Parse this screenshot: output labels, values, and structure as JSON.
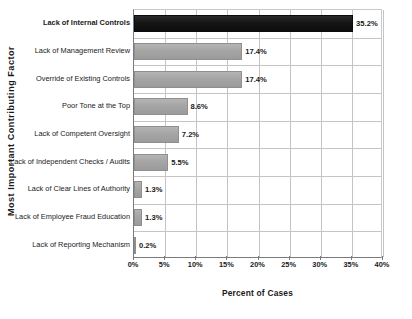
{
  "chart_data": {
    "type": "bar",
    "orientation": "horizontal",
    "title": "",
    "xlabel": "Percent of Cases",
    "ylabel": "Most Important Contributing Factor",
    "categories": [
      "Lack of Internal Controls",
      "Lack of Management Review",
      "Override of Existing Controls",
      "Poor Tone at the Top",
      "Lack of Competent Oversight",
      "Lack of Independent Checks / Audits",
      "Lack of Clear Lines of Authority",
      "Lack of Employee Fraud Education",
      "Lack of Reporting Mechanism"
    ],
    "values": [
      35.2,
      17.4,
      17.4,
      8.6,
      7.2,
      5.5,
      1.3,
      1.3,
      0.2
    ],
    "value_labels": [
      "35.2%",
      "17.4%",
      "17.4%",
      "8.6%",
      "7.2%",
      "5.5%",
      "1.3%",
      "1.3%",
      "0.2%"
    ],
    "xlim": [
      0,
      40
    ],
    "xticks": [
      0,
      5,
      10,
      15,
      20,
      25,
      30,
      35,
      40
    ],
    "xtick_labels": [
      "0%",
      "5%",
      "10%",
      "15%",
      "20%",
      "25%",
      "30%",
      "35%",
      "40%"
    ],
    "grid": true,
    "legend": false,
    "bar_color": "#a5a5a5",
    "highlight_color": "#151515",
    "highlight_index": 0,
    "gridline_color": "#c4c4c4",
    "axis_color": "#7a7a7a"
  }
}
